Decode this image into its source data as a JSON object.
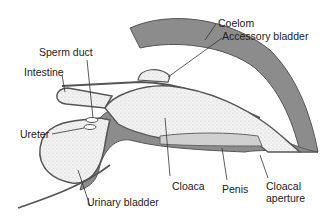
{
  "diagram": {
    "type": "anatomical cross-section",
    "labels": {
      "coelom": "Coelom",
      "accessory_bladder": "Accessory bladder",
      "sperm_duct": "Sperm duct",
      "intestine": "Intestine",
      "ureter": "Ureter",
      "urinary_bladder": "Urinary bladder",
      "cloaca": "Cloaca",
      "penis": "Penis",
      "cloacal_aperture_line1": "Cloacal",
      "cloacal_aperture_line2": "aperture"
    },
    "colors": {
      "body_wall": "#8c8c8c",
      "tissue_outline": "#555555",
      "stipple_fill": "#e8e8e8",
      "background": "#ffffff"
    }
  }
}
